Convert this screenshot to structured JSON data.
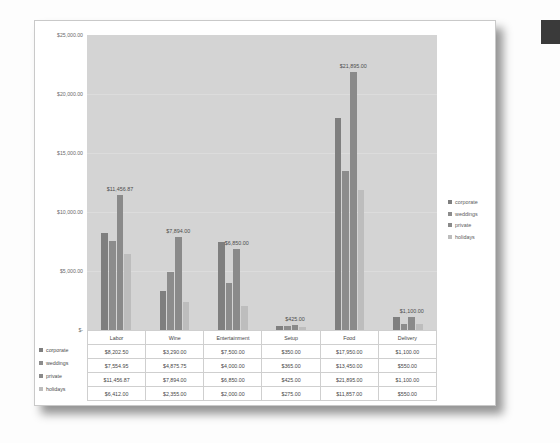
{
  "accent": {
    "square_color": "#3a3a3a"
  },
  "chart_data": {
    "type": "bar",
    "title": "July Party Sales",
    "xlabel": "",
    "ylabel": "",
    "ylim": [
      0,
      25000
    ],
    "grid": true,
    "legend_position": "right",
    "categories": [
      "Labor",
      "Wine",
      "Entertainment",
      "Setup",
      "Food",
      "Delivery"
    ],
    "y_ticks": [
      "$-",
      "$5,000.00",
      "$10,000.00",
      "$15,000.00",
      "$20,000.00",
      "$25,000.00"
    ],
    "y_tick_values": [
      0,
      5000,
      10000,
      15000,
      20000,
      25000
    ],
    "series": [
      {
        "name": "corporate",
        "color": "#7f7f7f",
        "values": [
          8202.5,
          3290.0,
          7500.0,
          350.0,
          17950.0,
          1100.0
        ],
        "labels": [
          "$8,202.50",
          "$3,290.00",
          "$7,500.00",
          "$350.00",
          "$17,950.00",
          "$1,100.00"
        ]
      },
      {
        "name": "weddings",
        "color": "#8c8c8c",
        "values": [
          7554.95,
          4875.75,
          4000.0,
          365.0,
          13450.0,
          550.0
        ],
        "labels": [
          "$7,554.95",
          "$4,875.75",
          "$4,000.00",
          "$365.00",
          "$13,450.00",
          "$550.00"
        ]
      },
      {
        "name": "private",
        "color": "#8a8a8a",
        "values": [
          11456.87,
          7894.0,
          6850.0,
          425.0,
          21895.0,
          1100.0
        ],
        "labels": [
          "$11,456.87",
          "$7,894.00",
          "$6,850.00",
          "$425.00",
          "$21,895.00",
          "$1,100.00"
        ]
      },
      {
        "name": "holidays",
        "color": "#bdbdbd",
        "values": [
          6412.0,
          2355.0,
          2000.0,
          275.0,
          11857.0,
          550.0
        ],
        "labels": [
          "$6,412.00",
          "$2,355.00",
          "$2,000.00",
          "$275.00",
          "$11,857.00",
          "$550.00"
        ]
      }
    ],
    "data_labels": [
      {
        "category": "Labor",
        "series": "private",
        "text": "$11,456.87"
      },
      {
        "category": "Wine",
        "series": "private",
        "text": "$7,894.00"
      },
      {
        "category": "Entertainment",
        "series": "private",
        "text": "$6,850.00"
      },
      {
        "category": "Setup",
        "series": "private",
        "text": "$425.00"
      },
      {
        "category": "Food",
        "series": "private",
        "text": "$21,895.00"
      },
      {
        "category": "Delivery",
        "series": "private",
        "text": "$1,100.00"
      }
    ]
  }
}
